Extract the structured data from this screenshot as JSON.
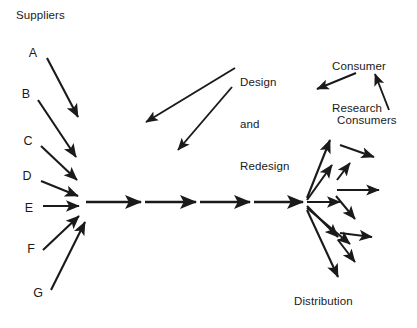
{
  "figure": {
    "type": "flow-diagram",
    "background_color": "#ffffff",
    "ink_color": "#1a1a1a",
    "width": 417,
    "height": 328
  },
  "labels": {
    "suppliers_heading": "Suppliers",
    "design_line1": "Design",
    "design_line2": "and",
    "design_line3": "Redesign",
    "consumer_research_line1": "Consumer",
    "consumer_research_line2": "Research",
    "consumers": "Consumers",
    "distribution": "Distribution"
  },
  "suppliers": [
    {
      "id": "A",
      "label": "A",
      "x": 33,
      "y": 57
    },
    {
      "id": "B",
      "label": "B",
      "x": 26,
      "y": 98
    },
    {
      "id": "C",
      "label": "C",
      "x": 28,
      "y": 145
    },
    {
      "id": "D",
      "label": "D",
      "x": 27,
      "y": 180
    },
    {
      "id": "E",
      "label": "E",
      "x": 29,
      "y": 212
    },
    {
      "id": "F",
      "label": "F",
      "x": 31,
      "y": 253
    },
    {
      "id": "G",
      "label": "G",
      "x": 38,
      "y": 297
    }
  ],
  "nodes": {
    "inbound_hub": {
      "x": 80,
      "y": 202
    },
    "outbound_hub": {
      "x": 305,
      "y": 202
    }
  },
  "supplier_arrows": [
    {
      "from_supplier": "A",
      "x1": 47,
      "y1": 58,
      "x2": 78,
      "y2": 117
    },
    {
      "from_supplier": "B",
      "x1": 38,
      "y1": 100,
      "x2": 76,
      "y2": 157
    },
    {
      "from_supplier": "C",
      "x1": 41,
      "y1": 146,
      "x2": 77,
      "y2": 180
    },
    {
      "from_supplier": "D",
      "x1": 41,
      "y1": 181,
      "x2": 78,
      "y2": 196
    },
    {
      "from_supplier": "E",
      "x1": 43,
      "y1": 206,
      "x2": 79,
      "y2": 206
    },
    {
      "from_supplier": "F",
      "x1": 43,
      "y1": 250,
      "x2": 79,
      "y2": 216
    },
    {
      "from_supplier": "G",
      "x1": 51,
      "y1": 290,
      "x2": 85,
      "y2": 222
    }
  ],
  "process_chain": [
    {
      "x1": 86,
      "y1": 202,
      "x2": 141,
      "y2": 202
    },
    {
      "x1": 145,
      "y1": 202,
      "x2": 196,
      "y2": 202
    },
    {
      "x1": 200,
      "y1": 202,
      "x2": 250,
      "y2": 202
    },
    {
      "x1": 254,
      "y1": 202,
      "x2": 303,
      "y2": 202
    }
  ],
  "distribution_arrows": [
    {
      "x1": 307,
      "y1": 198,
      "x2": 330,
      "y2": 140
    },
    {
      "x1": 307,
      "y1": 200,
      "x2": 332,
      "y2": 165
    },
    {
      "x1": 307,
      "y1": 202,
      "x2": 340,
      "y2": 202
    },
    {
      "x1": 307,
      "y1": 206,
      "x2": 338,
      "y2": 237
    },
    {
      "x1": 307,
      "y1": 208,
      "x2": 350,
      "y2": 244
    },
    {
      "x1": 307,
      "y1": 210,
      "x2": 338,
      "y2": 277
    }
  ],
  "distribution_secondary_arrows": [
    {
      "x1": 340,
      "y1": 145,
      "x2": 374,
      "y2": 157
    },
    {
      "x1": 337,
      "y1": 190,
      "x2": 379,
      "y2": 190
    },
    {
      "x1": 337,
      "y1": 180,
      "x2": 350,
      "y2": 163
    },
    {
      "x1": 336,
      "y1": 196,
      "x2": 355,
      "y2": 219
    },
    {
      "x1": 340,
      "y1": 233,
      "x2": 372,
      "y2": 237
    },
    {
      "x1": 338,
      "y1": 240,
      "x2": 355,
      "y2": 262
    }
  ],
  "feedback_arrows": [
    {
      "name": "design-feedback-upper",
      "x1": 235,
      "y1": 68,
      "x2": 146,
      "y2": 122,
      "source_label": "Design and Redesign"
    },
    {
      "name": "design-feedback-lower",
      "x1": 232,
      "y1": 87,
      "x2": 178,
      "y2": 150,
      "source_label": "Design and Redesign"
    },
    {
      "name": "consumer-research-output",
      "x1": 356,
      "y1": 73,
      "x2": 317,
      "y2": 89,
      "source_label": "Consumer Research"
    },
    {
      "name": "consumers-to-consumer-research",
      "x1": 389,
      "y1": 110,
      "x2": 375,
      "y2": 74,
      "source_label": "Consumers"
    }
  ],
  "label_positions": {
    "suppliers_heading": {
      "x": 16,
      "y": 9
    },
    "design_block": {
      "x": 240,
      "y": 50
    },
    "consumer_research_block": {
      "x": 332,
      "y": 34
    },
    "consumers": {
      "x": 337,
      "y": 114
    },
    "distribution": {
      "x": 294,
      "y": 295
    }
  }
}
